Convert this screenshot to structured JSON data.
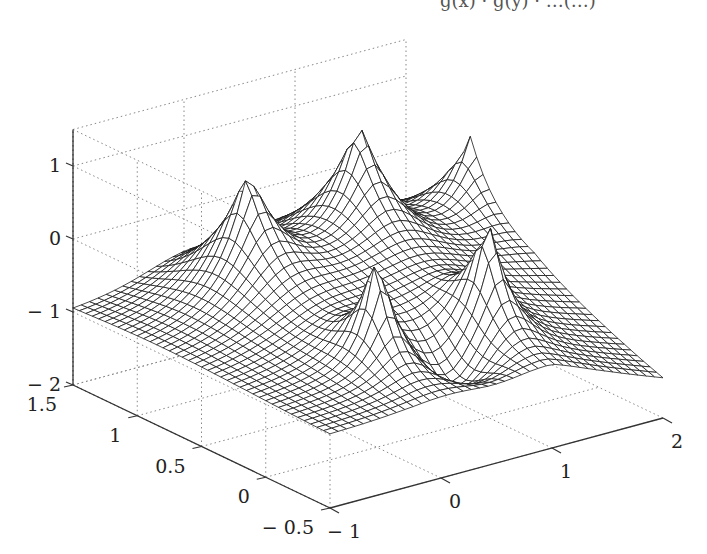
{
  "title_fragment": "g(x) · g(y) · …(…)",
  "chart_data": {
    "type": "surface",
    "title": "",
    "xlabel": "",
    "ylabel": "",
    "zlabel": "",
    "x_range": [
      -1,
      2
    ],
    "y_range": [
      -0.5,
      1.5
    ],
    "z_range": [
      -2,
      1.5
    ],
    "x_ticks": [
      "− 1",
      "0",
      "1",
      "2"
    ],
    "x_tick_values": [
      -1,
      0,
      1,
      2
    ],
    "y_ticks": [
      "− 0.5",
      "0",
      "0.5",
      "1",
      "1.5"
    ],
    "y_tick_values": [
      -0.5,
      0,
      0.5,
      1,
      1.5
    ],
    "z_ticks": [
      "− 2",
      "− 1",
      "0",
      "1"
    ],
    "z_tick_values": [
      -2,
      -1,
      0,
      1
    ],
    "grid": "dotted",
    "mesh_resolution": 40,
    "mesh_color": "#1a1a1a",
    "face_color": "#ffffff",
    "grid_color": "#888888",
    "axis_color": "#333333",
    "peaks": [
      {
        "x": 0,
        "y": 1,
        "height": 1.3,
        "type": "cusp"
      },
      {
        "x": 1,
        "y": 1,
        "height": 1.4,
        "type": "cusp"
      },
      {
        "x": 2,
        "y": 1,
        "height": 1.0,
        "type": "cusp"
      },
      {
        "x": 0,
        "y": 0,
        "height": 0.6,
        "type": "spike"
      },
      {
        "x": 1,
        "y": 0,
        "height": 0.6,
        "type": "spike"
      }
    ],
    "corner_values": {
      "x=-1,y=1.5": -1.0,
      "x=-1,y=-0.5": -1.0,
      "x=2,y=-0.5": -1.5,
      "x=2,y=1.5": -1.0
    }
  },
  "projection": {
    "origin_px": [
      330,
      508
    ],
    "x_unit_px": [
      111,
      -30
    ],
    "y_unit_px": [
      -128.5,
      -61.5
    ],
    "z_unit_px": [
      0,
      -73
    ],
    "z_floor": -2,
    "x_min": -1,
    "y_min": -0.5
  }
}
